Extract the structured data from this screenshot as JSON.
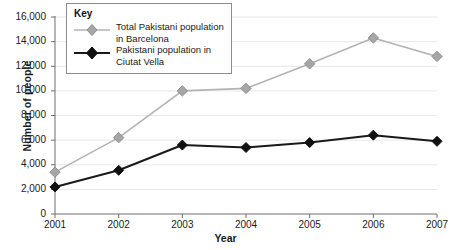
{
  "chart_data": {
    "type": "line",
    "title": "",
    "xlabel": "Year",
    "ylabel": "Number of people",
    "categories": [
      "2001",
      "2002",
      "2003",
      "2004",
      "2005",
      "2006",
      "2007"
    ],
    "x": [
      2001,
      2002,
      2003,
      2004,
      2005,
      2006,
      2007
    ],
    "xlim": [
      2001,
      2007
    ],
    "ylim": [
      0,
      16000
    ],
    "y_ticks": [
      0,
      2000,
      4000,
      6000,
      8000,
      10000,
      12000,
      14000,
      16000
    ],
    "y_tick_labels": [
      "0",
      "2,000",
      "4,000",
      "6,000",
      "8,000",
      "10,000",
      "12,000",
      "14,000",
      "16,000"
    ],
    "grid": true,
    "legend_position": "top-left",
    "series": [
      {
        "name": "Total Pakistani population in Barcelona",
        "color": "#b3b3b3",
        "marker": "diamond",
        "marker_fill": "#a6a6a6",
        "values": [
          3400,
          6200,
          10000,
          10200,
          12200,
          14300,
          12800
        ]
      },
      {
        "name": "Pakistani population in Ciutat Vella",
        "color": "#1a1a1a",
        "marker": "diamond",
        "marker_fill": "#111111",
        "values": [
          2200,
          3550,
          5600,
          5400,
          5800,
          6400,
          5900
        ]
      }
    ]
  },
  "legend": {
    "title": "Key",
    "entries": [
      {
        "label_line1": "Total Pakistani population",
        "label_line2": "in Barcelona"
      },
      {
        "label_line1": "Pakistani population in",
        "label_line2": "Ciutat Vella"
      }
    ]
  },
  "axes": {
    "y_title": "Number of people",
    "x_title": "Year"
  }
}
